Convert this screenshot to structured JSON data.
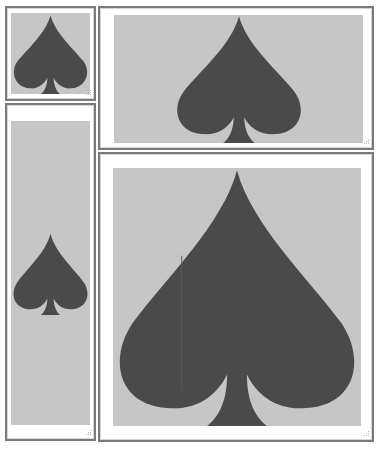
{
  "canvas": {
    "background": "#ffffff",
    "panel_border_color": "#7a7a7a",
    "image_background_color": "#c6c6c6",
    "spade_color": "#4a4a4a"
  },
  "panels": [
    {
      "id": "top-left",
      "label": "Spade image (small square)",
      "icon": "spade-icon",
      "corner_icon": "resize-grip-icon"
    },
    {
      "id": "top-right",
      "label": "Spade image (wide)",
      "icon": "spade-icon",
      "corner_icon": "resize-grip-icon"
    },
    {
      "id": "left-tall",
      "label": "Spade image (tall)",
      "icon": "spade-icon",
      "corner_icon": "resize-grip-icon"
    },
    {
      "id": "bottom-right",
      "label": "Spade image (large)",
      "icon": "spade-icon",
      "corner_icon": "resize-grip-icon"
    }
  ]
}
